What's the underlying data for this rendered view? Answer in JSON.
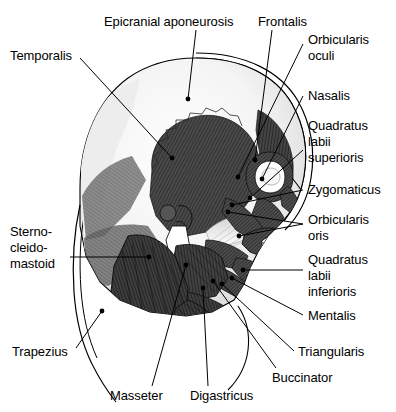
{
  "figure": {
    "view": "lateral-right",
    "background_color": "#ffffff",
    "line_color": "#000000",
    "muscle_dark": "#3a3a3a",
    "muscle_mid": "#6e6e6e",
    "bone_light": "#f2f2f2",
    "font_size_px": 13
  },
  "labels": [
    {
      "id": "temporalis",
      "name": "Temporalis",
      "lines": [
        "Temporalis"
      ],
      "side": "left",
      "text_x": 10,
      "text_y": 48,
      "leader": [
        [
          80,
          58
        ],
        [
          172,
          158
        ]
      ],
      "dot": [
        172,
        158
      ]
    },
    {
      "id": "epicranial-aponeurosis",
      "name": "Epicranial aponeurosis",
      "lines": [
        "Epicranial aponeurosis"
      ],
      "side": "top",
      "text_x": 104,
      "text_y": 14,
      "leader": [
        [
          196,
          30
        ],
        [
          188,
          99
        ]
      ],
      "dot": [
        188,
        99
      ]
    },
    {
      "id": "frontalis",
      "name": "Frontalis",
      "lines": [
        "Frontalis"
      ],
      "side": "top",
      "text_x": 258,
      "text_y": 14,
      "leader": [
        [
          272,
          30
        ],
        [
          255,
          160
        ]
      ],
      "dot": [
        255,
        160
      ]
    },
    {
      "id": "orbicularis-oculi",
      "name": "Orbicularis oculi",
      "lines": [
        "Orbicularis",
        "oculi"
      ],
      "side": "right",
      "text_x": 308,
      "text_y": 32,
      "leader": [
        [
          303,
          44
        ],
        [
          238,
          177
        ]
      ],
      "dot": [
        238,
        177
      ]
    },
    {
      "id": "nasalis",
      "name": "Nasalis",
      "lines": [
        "Nasalis"
      ],
      "side": "right",
      "text_x": 308,
      "text_y": 88,
      "leader": [
        [
          303,
          96
        ],
        [
          262,
          179
        ]
      ],
      "dot": [
        262,
        179
      ]
    },
    {
      "id": "quadratus-labii-superioris",
      "name": "Quadratus labii superioris",
      "lines": [
        "Quadratus",
        "labii",
        "superioris"
      ],
      "side": "right",
      "text_x": 308,
      "text_y": 118,
      "leader": [
        [
          303,
          150
        ],
        [
          250,
          198
        ]
      ],
      "dot": [
        250,
        198
      ]
    },
    {
      "id": "zygomaticus",
      "name": "Zygomaticus",
      "lines": [
        "Zygomaticus"
      ],
      "side": "right",
      "text_x": 308,
      "text_y": 182,
      "leader": [
        [
          303,
          190
        ],
        [
          232,
          205
        ]
      ],
      "dot": [
        232,
        205
      ]
    },
    {
      "id": "orbicularis-oris",
      "name": "Orbicularis oris",
      "lines": [
        "Orbicularis",
        "oris"
      ],
      "side": "right",
      "text_x": 308,
      "text_y": 212,
      "leader": [
        [
          303,
          224
        ],
        [
          228,
          212
        ]
      ],
      "dot": [
        228,
        212
      ],
      "leader2": [
        [
          303,
          224
        ],
        [
          239,
          236
        ]
      ],
      "dot2": [
        239,
        236
      ]
    },
    {
      "id": "quadratus-labii-inferioris",
      "name": "Quadratus labii inferioris",
      "lines": [
        "Quadratus",
        "labii",
        "inferioris"
      ],
      "side": "right",
      "text_x": 308,
      "text_y": 252,
      "leader": [
        [
          303,
          270
        ],
        [
          243,
          270
        ]
      ],
      "dot": [
        243,
        270
      ]
    },
    {
      "id": "mentalis",
      "name": "Mentalis",
      "lines": [
        "Mentalis"
      ],
      "side": "right",
      "text_x": 308,
      "text_y": 308,
      "leader": [
        [
          303,
          315
        ],
        [
          232,
          278
        ]
      ],
      "dot": [
        232,
        278
      ]
    },
    {
      "id": "triangularis",
      "name": "Triangularis",
      "lines": [
        "Triangularis"
      ],
      "side": "right",
      "text_x": 298,
      "text_y": 344,
      "leader": [
        [
          294,
          351
        ],
        [
          222,
          284
        ]
      ],
      "dot": [
        222,
        284
      ]
    },
    {
      "id": "buccinator",
      "name": "Buccinator",
      "lines": [
        "Buccinator"
      ],
      "side": "bottom",
      "text_x": 272,
      "text_y": 370,
      "leader": [
        [
          276,
          368
        ],
        [
          213,
          281
        ]
      ],
      "dot": [
        213,
        281
      ]
    },
    {
      "id": "digastricus",
      "name": "Digastricus",
      "lines": [
        "Digastricus"
      ],
      "side": "bottom",
      "text_x": 190,
      "text_y": 388,
      "leader": [
        [
          208,
          386
        ],
        [
          203,
          288
        ]
      ],
      "dot": [
        203,
        288
      ]
    },
    {
      "id": "masseter",
      "name": "Masseter",
      "lines": [
        "Masseter"
      ],
      "side": "bottom",
      "text_x": 110,
      "text_y": 388,
      "leader": [
        [
          152,
          386
        ],
        [
          186,
          265
        ]
      ],
      "dot": [
        186,
        265
      ]
    },
    {
      "id": "trapezius",
      "name": "Trapezius",
      "lines": [
        "Trapezius"
      ],
      "side": "left",
      "text_x": 12,
      "text_y": 344,
      "leader": [
        [
          76,
          348
        ],
        [
          102,
          311
        ]
      ],
      "dot": [
        102,
        311
      ]
    },
    {
      "id": "sternocleidomastoid",
      "name": "Sternocleidomastoid",
      "lines": [
        "Sterno-",
        "cleido-",
        "mastoid"
      ],
      "side": "left",
      "text_x": 10,
      "text_y": 224,
      "leader": [
        [
          70,
          257
        ],
        [
          149,
          257
        ]
      ],
      "dot": [
        149,
        257
      ]
    }
  ]
}
